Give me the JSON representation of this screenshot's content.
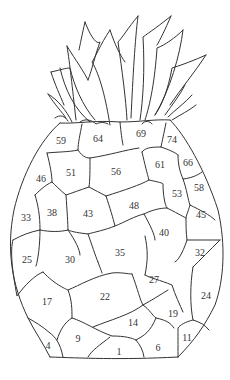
{
  "illustration": {
    "subject": "pineapple",
    "regions": [
      {
        "n": "59",
        "x": 61,
        "y": 141
      },
      {
        "n": "64",
        "x": 98,
        "y": 139
      },
      {
        "n": "69",
        "x": 141,
        "y": 134
      },
      {
        "n": "74",
        "x": 172,
        "y": 140
      },
      {
        "n": "46",
        "x": 41,
        "y": 179
      },
      {
        "n": "51",
        "x": 71,
        "y": 173
      },
      {
        "n": "56",
        "x": 116,
        "y": 172
      },
      {
        "n": "61",
        "x": 160,
        "y": 165
      },
      {
        "n": "66",
        "x": 188,
        "y": 163
      },
      {
        "n": "53",
        "x": 177,
        "y": 194
      },
      {
        "n": "58",
        "x": 199,
        "y": 188
      },
      {
        "n": "33",
        "x": 26,
        "y": 218
      },
      {
        "n": "38",
        "x": 52,
        "y": 213
      },
      {
        "n": "43",
        "x": 88,
        "y": 214
      },
      {
        "n": "48",
        "x": 134,
        "y": 206
      },
      {
        "n": "45",
        "x": 201,
        "y": 215
      },
      {
        "n": "40",
        "x": 164,
        "y": 233
      },
      {
        "n": "25",
        "x": 27,
        "y": 260
      },
      {
        "n": "30",
        "x": 70,
        "y": 260
      },
      {
        "n": "35",
        "x": 120,
        "y": 253
      },
      {
        "n": "32",
        "x": 200,
        "y": 253
      },
      {
        "n": "27",
        "x": 154,
        "y": 280
      },
      {
        "n": "17",
        "x": 47,
        "y": 302
      },
      {
        "n": "22",
        "x": 105,
        "y": 297
      },
      {
        "n": "24",
        "x": 206,
        "y": 296
      },
      {
        "n": "19",
        "x": 173,
        "y": 314
      },
      {
        "n": "14",
        "x": 133,
        "y": 323
      },
      {
        "n": "11",
        "x": 187,
        "y": 338
      },
      {
        "n": "9",
        "x": 78,
        "y": 339
      },
      {
        "n": "4",
        "x": 48,
        "y": 346
      },
      {
        "n": "1",
        "x": 119,
        "y": 352
      },
      {
        "n": "6",
        "x": 158,
        "y": 348
      }
    ]
  }
}
